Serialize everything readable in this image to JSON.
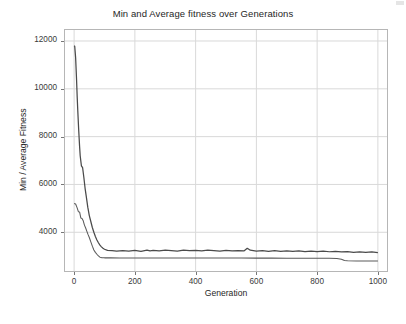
{
  "figure": {
    "title": "Min and Average fitness over Generations",
    "background": "#ffffff",
    "axis_color": "#b6b6b6",
    "grid_color": "#d9d9d9",
    "text_color": "#262626"
  },
  "axes": {
    "xlabel": "Generation",
    "ylabel": "Min / Average Fitness",
    "xticks": [
      0,
      200,
      400,
      600,
      800,
      1000
    ],
    "xtick_labels": [
      "0",
      "200",
      "400",
      "600",
      "800",
      "1000"
    ],
    "yticks": [
      4000,
      6000,
      8000,
      10000,
      12000
    ],
    "ytick_labels": [
      "4000",
      "6000",
      "8000",
      "10000",
      "12000"
    ],
    "xlim": [
      -30,
      1030
    ],
    "ylim": [
      2380,
      12460
    ],
    "grid": true
  },
  "chart_data": {
    "type": "line",
    "title": "Min and Average fitness over Generations",
    "xlabel": "Generation",
    "ylabel": "Min / Average Fitness",
    "xlim": [
      -30,
      1030
    ],
    "ylim": [
      2380,
      12460
    ],
    "xticks": [
      0,
      200,
      400,
      600,
      800,
      1000
    ],
    "yticks": [
      4000,
      6000,
      8000,
      10000,
      12000
    ],
    "grid": true,
    "legend": "none",
    "line_color": "#4a4a4a",
    "series": [
      {
        "name": "Average Fitness",
        "color": "#4a4a4a",
        "x": [
          0,
          2,
          5,
          8,
          10,
          12,
          15,
          18,
          20,
          24,
          28,
          32,
          36,
          40,
          45,
          50,
          55,
          60,
          65,
          70,
          75,
          80,
          85,
          90,
          95,
          100,
          110,
          125,
          140,
          160,
          180,
          200,
          220,
          240,
          250,
          260,
          280,
          300,
          320,
          340,
          360,
          380,
          400,
          420,
          440,
          460,
          480,
          500,
          520,
          540,
          560,
          570,
          580,
          600,
          620,
          640,
          660,
          680,
          700,
          720,
          740,
          760,
          780,
          800,
          820,
          840,
          860,
          880,
          900,
          920,
          940,
          960,
          980,
          1000
        ],
        "y": [
          11800,
          11780,
          11300,
          10400,
          9700,
          9100,
          8300,
          7600,
          7200,
          6780,
          6700,
          6300,
          5850,
          5500,
          5050,
          4700,
          4450,
          4200,
          4000,
          3820,
          3680,
          3560,
          3460,
          3390,
          3330,
          3290,
          3240,
          3230,
          3210,
          3230,
          3215,
          3240,
          3205,
          3250,
          3225,
          3240,
          3220,
          3250,
          3230,
          3215,
          3250,
          3230,
          3245,
          3220,
          3250,
          3230,
          3215,
          3245,
          3220,
          3235,
          3225,
          3330,
          3250,
          3215,
          3230,
          3200,
          3230,
          3205,
          3225,
          3200,
          3220,
          3195,
          3215,
          3190,
          3210,
          3185,
          3200,
          3175,
          3195,
          3160,
          3180,
          3155,
          3175,
          3150
        ]
      },
      {
        "name": "Min Fitness",
        "color": "#5a5a5a",
        "x": [
          0,
          5,
          10,
          14,
          18,
          22,
          26,
          30,
          34,
          38,
          42,
          46,
          50,
          55,
          60,
          65,
          70,
          75,
          80,
          85,
          90,
          95,
          100,
          120,
          150,
          200,
          250,
          300,
          350,
          400,
          450,
          500,
          550,
          600,
          650,
          700,
          750,
          800,
          840,
          865,
          880,
          890,
          900,
          930,
          960,
          1000
        ],
        "y": [
          5200,
          5180,
          5020,
          4860,
          4850,
          4600,
          4580,
          4480,
          4300,
          4180,
          4040,
          3900,
          3780,
          3600,
          3420,
          3260,
          3160,
          3080,
          3010,
          2960,
          2940,
          2935,
          2930,
          2930,
          2928,
          2928,
          2926,
          2926,
          2924,
          2924,
          2922,
          2922,
          2920,
          2918,
          2918,
          2916,
          2916,
          2914,
          2912,
          2905,
          2870,
          2820,
          2805,
          2800,
          2798,
          2795
        ]
      }
    ]
  }
}
